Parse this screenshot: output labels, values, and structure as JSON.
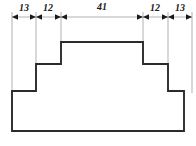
{
  "drawing": {
    "type": "engineering-dimension-drawing",
    "description": "Symmetric stepped profile with top dimension line",
    "canvas": {
      "width": 196,
      "height": 146
    },
    "colors": {
      "background": "#ffffff",
      "outline": "#2b2b2b",
      "extension_line": "#8f8f8f",
      "dimension_line": "#8f8f8f",
      "label_text": "#1a1a1a"
    },
    "dimension_line": {
      "y": 17,
      "x_start": 12,
      "x_end": 192
    },
    "dimensions": [
      {
        "label": "13",
        "value": 13,
        "x_from": 12,
        "x_to": 36,
        "label_x": 24,
        "label_y": 3
      },
      {
        "label": "12",
        "value": 12,
        "x_from": 36,
        "x_to": 61,
        "label_x": 48,
        "label_y": 3
      },
      {
        "label": "41",
        "value": 41,
        "x_from": 61,
        "x_to": 143,
        "label_x": 102,
        "label_y": 2
      },
      {
        "label": "12",
        "value": 12,
        "x_from": 143,
        "x_to": 168,
        "label_x": 155,
        "label_y": 3
      },
      {
        "label": "13",
        "value": 13,
        "x_from": 168,
        "x_to": 192,
        "label_x": 180,
        "label_y": 3
      }
    ],
    "extension_lines": [
      {
        "x": 12,
        "y_top": 12,
        "y_bottom": 93
      },
      {
        "x": 36,
        "y_top": 12,
        "y_bottom": 66
      },
      {
        "x": 61,
        "y_top": 12,
        "y_bottom": 44
      },
      {
        "x": 143,
        "y_top": 12,
        "y_bottom": 44
      },
      {
        "x": 168,
        "y_top": 12,
        "y_bottom": 66
      },
      {
        "x": 192,
        "y_top": 12,
        "y_bottom": 93
      }
    ],
    "profile_path": "M 12 91 L 12 131 L 184 131 L 184 91 L 168 91 L 168 64 L 143 64 L 143 42 L 61 42 L 61 64 L 36 64 L 36 91 Z",
    "profile_levels": {
      "baseline_y": 131,
      "base_top_y": 91,
      "mid_step_y": 64,
      "plateau_y": 42,
      "left_outer_x": 12,
      "left_mid_x": 36,
      "left_inner_x": 61,
      "right_inner_x": 143,
      "right_mid_x": 168,
      "right_outer_x": 184
    }
  }
}
